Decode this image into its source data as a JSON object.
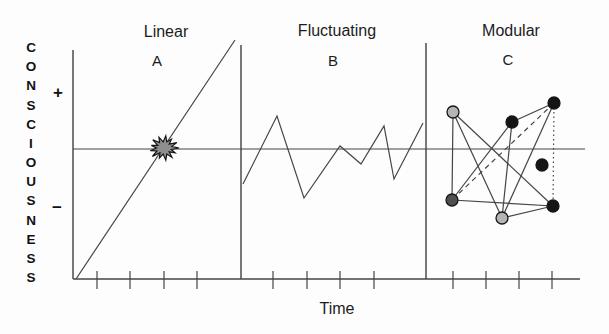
{
  "figure": {
    "y_axis_label": "CONSCIOUSNESS",
    "plus_label": "+",
    "minus_label": "−",
    "x_axis_label": "Time",
    "panels": [
      {
        "id": "A",
        "title": "Linear",
        "letter": "A"
      },
      {
        "id": "B",
        "title": "Fluctuating",
        "letter": "B"
      },
      {
        "id": "C",
        "title": "Modular",
        "letter": "C"
      }
    ]
  },
  "colors": {
    "line": "#454545",
    "text": "#1c1c1c",
    "background": "#fdfdfd",
    "burst_fill": "#8e8e8e",
    "burst_stroke": "#161616",
    "node_black": "#151515",
    "node_gray": "#b5b5b5",
    "node_dark_gray": "#4f4f4f",
    "node_stroke": "#161616"
  },
  "geometry": {
    "y_axis": {
      "x": 73,
      "y1": 50,
      "y2": 279
    },
    "baseline": {
      "y": 279,
      "x1": 73,
      "x2": 580
    },
    "midline": {
      "y": 149,
      "x1": 73,
      "x2": 585
    },
    "dividers": [
      {
        "x": 241,
        "y1": 45,
        "y2": 279
      },
      {
        "x": 426,
        "y1": 43,
        "y2": 279
      }
    ],
    "ticks": {
      "xs": [
        97,
        130,
        164,
        197,
        273,
        307,
        340,
        374,
        453,
        486,
        519,
        552
      ],
      "up": 8,
      "down": 10
    },
    "linear_line": {
      "x1": 76,
      "y1": 279,
      "x2": 235,
      "y2": 40
    },
    "burst": {
      "cx": 164,
      "cy": 148
    },
    "zigzag": [
      [
        243,
        184
      ],
      [
        277,
        116
      ],
      [
        304,
        198
      ],
      [
        340,
        146
      ],
      [
        361,
        164
      ],
      [
        384,
        126
      ],
      [
        394,
        179
      ],
      [
        423,
        123
      ]
    ],
    "nodes": [
      {
        "id": "n1",
        "x": 453,
        "y": 112,
        "r": 6,
        "color": "node_gray"
      },
      {
        "id": "n2",
        "x": 512,
        "y": 122,
        "r": 6,
        "color": "node_black"
      },
      {
        "id": "n3",
        "x": 554,
        "y": 103,
        "r": 6,
        "color": "node_black"
      },
      {
        "id": "n4",
        "x": 542,
        "y": 165,
        "r": 6,
        "color": "node_black"
      },
      {
        "id": "n5",
        "x": 452,
        "y": 200,
        "r": 6,
        "color": "node_dark_gray"
      },
      {
        "id": "n6",
        "x": 502,
        "y": 218,
        "r": 6,
        "color": "node_gray"
      },
      {
        "id": "n7",
        "x": 553,
        "y": 206,
        "r": 6,
        "color": "node_black"
      }
    ],
    "edges": [
      {
        "from": "n1",
        "to": "n5",
        "style": "solid"
      },
      {
        "from": "n1",
        "to": "n6",
        "style": "solid"
      },
      {
        "from": "n1",
        "to": "n7",
        "style": "solid"
      },
      {
        "from": "n2",
        "to": "n5",
        "style": "solid"
      },
      {
        "from": "n2",
        "to": "n6",
        "style": "solid"
      },
      {
        "from": "n2",
        "to": "n3",
        "style": "solid"
      },
      {
        "from": "n3",
        "to": "n5",
        "style": "dashed"
      },
      {
        "from": "n3",
        "to": "n6",
        "style": "solid"
      },
      {
        "from": "n3",
        "to": "n7",
        "style": "dotted"
      },
      {
        "from": "n5",
        "to": "n7",
        "style": "solid"
      },
      {
        "from": "n6",
        "to": "n7",
        "style": "solid"
      }
    ]
  }
}
